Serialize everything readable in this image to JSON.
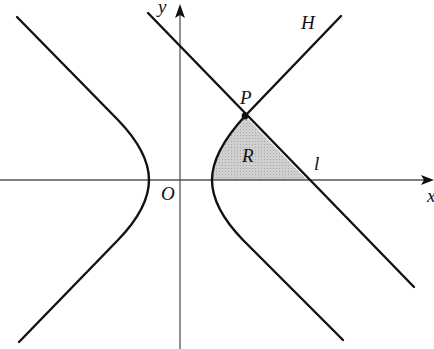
{
  "diagram": {
    "type": "coordinate-geometry",
    "labels": {
      "y_axis": "y",
      "x_axis": "x",
      "origin": "O",
      "hyperbola": "H",
      "point": "P",
      "region": "R",
      "line": "l"
    },
    "colors": {
      "stroke": "#111111",
      "axis": "#555555",
      "shade": "#c8c8c8"
    },
    "points": {
      "origin_px": [
        180,
        180
      ],
      "P_px": [
        245,
        116
      ],
      "l_x_intercept_px": [
        307,
        180
      ]
    }
  }
}
